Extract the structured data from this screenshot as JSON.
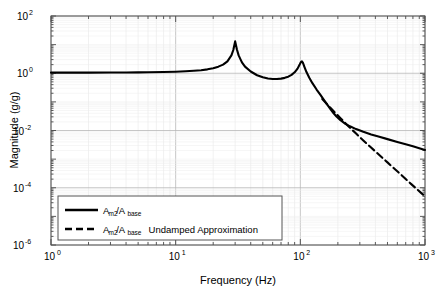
{
  "chart_data": {
    "type": "line",
    "title": "",
    "xlabel": "Frequency (Hz)",
    "ylabel": "Magnitude (g/g)",
    "xscale": "log",
    "yscale": "log",
    "xlim": [
      1,
      1000
    ],
    "ylim": [
      1e-06,
      100
    ],
    "grid": true,
    "xticks": [
      1,
      10,
      100,
      1000
    ],
    "xtick_labels": [
      "10^0",
      "10^1",
      "10^2",
      "10^3"
    ],
    "xtick_mantissa": [
      "10",
      "10",
      "10",
      "10"
    ],
    "xtick_exponents": [
      "0",
      "1",
      "2",
      "3"
    ],
    "yticks": [
      100,
      1,
      0.01,
      0.0001,
      1e-06
    ],
    "ytick_labels": [
      "10^2",
      "10^0",
      "10^-2",
      "10^-4",
      "10^-6"
    ],
    "ytick_mantissa": [
      "10",
      "10",
      "10",
      "10",
      "10"
    ],
    "ytick_exponents": [
      "2",
      "0",
      "-2",
      "-4",
      "-6"
    ],
    "legend_position": "lower-left",
    "resonances_hz": [
      30,
      103
    ],
    "peak_values": [
      13,
      2.6
    ],
    "series": [
      {
        "name": "A_m2/A_base",
        "style": "solid",
        "color": "#000000",
        "points": [
          [
            1.0,
            1.05
          ],
          [
            1.5,
            1.05
          ],
          [
            2.0,
            1.05
          ],
          [
            3.0,
            1.06
          ],
          [
            4.0,
            1.06
          ],
          [
            5.0,
            1.07
          ],
          [
            6.0,
            1.08
          ],
          [
            8.0,
            1.1
          ],
          [
            10.0,
            1.13
          ],
          [
            12.0,
            1.17
          ],
          [
            14.0,
            1.22
          ],
          [
            16.0,
            1.28
          ],
          [
            18.0,
            1.37
          ],
          [
            20.0,
            1.5
          ],
          [
            22.0,
            1.7
          ],
          [
            24.0,
            2.0
          ],
          [
            26.0,
            2.6
          ],
          [
            28.0,
            4.2
          ],
          [
            29.0,
            6.5
          ],
          [
            30.0,
            13.0
          ],
          [
            31.0,
            6.8
          ],
          [
            32.0,
            4.2
          ],
          [
            34.0,
            2.4
          ],
          [
            36.0,
            1.7
          ],
          [
            40.0,
            1.15
          ],
          [
            45.0,
            0.85
          ],
          [
            50.0,
            0.72
          ],
          [
            55.0,
            0.66
          ],
          [
            60.0,
            0.63
          ],
          [
            65.0,
            0.63
          ],
          [
            70.0,
            0.65
          ],
          [
            75.0,
            0.69
          ],
          [
            80.0,
            0.76
          ],
          [
            85.0,
            0.88
          ],
          [
            90.0,
            1.08
          ],
          [
            95.0,
            1.45
          ],
          [
            99.0,
            2.05
          ],
          [
            101.0,
            2.45
          ],
          [
            103.0,
            2.6
          ],
          [
            105.0,
            2.3
          ],
          [
            108.0,
            1.65
          ],
          [
            112.0,
            1.1
          ],
          [
            118.0,
            0.7
          ],
          [
            125.0,
            0.45
          ],
          [
            135.0,
            0.27
          ],
          [
            145.0,
            0.175
          ],
          [
            155.0,
            0.115
          ],
          [
            165.0,
            0.078
          ],
          [
            175.0,
            0.055
          ],
          [
            185.0,
            0.04
          ],
          [
            195.0,
            0.031
          ],
          [
            210.0,
            0.023
          ],
          [
            230.0,
            0.017
          ],
          [
            250.0,
            0.014
          ],
          [
            280.0,
            0.0112
          ],
          [
            320.0,
            0.009
          ],
          [
            370.0,
            0.0073
          ],
          [
            430.0,
            0.006
          ],
          [
            500.0,
            0.005
          ],
          [
            600.0,
            0.004
          ],
          [
            700.0,
            0.0033
          ],
          [
            800.0,
            0.0028
          ],
          [
            900.0,
            0.0024
          ],
          [
            1000.0,
            0.0021
          ]
        ]
      },
      {
        "name": "A_m2/A_base Undamped Approximation",
        "style": "dashdot",
        "color": "#000000",
        "points": [
          [
            150.0,
            0.125
          ],
          [
            160.0,
            0.092
          ],
          [
            175.0,
            0.061
          ],
          [
            190.0,
            0.042
          ],
          [
            210.0,
            0.027
          ],
          [
            230.0,
            0.018
          ],
          [
            250.0,
            0.0125
          ],
          [
            280.0,
            0.0078
          ],
          [
            320.0,
            0.0045
          ],
          [
            360.0,
            0.0028
          ],
          [
            400.0,
            0.00185
          ],
          [
            450.0,
            0.00116
          ],
          [
            500.0,
            0.00077
          ],
          [
            560.0,
            0.00049
          ],
          [
            620.0,
            0.00033
          ],
          [
            700.0,
            0.000202
          ],
          [
            780.0,
            0.000131
          ],
          [
            860.0,
            8.95e-05
          ],
          [
            930.0,
            6.62e-05
          ],
          [
            1000.0,
            5e-05
          ]
        ]
      }
    ],
    "legend": [
      {
        "label_main": "A",
        "label_sub1": "m2",
        "label_slash": "/A",
        "label_sub2": "base",
        "label_extra": "",
        "style": "solid"
      },
      {
        "label_main": "A",
        "label_sub1": "m2",
        "label_slash": "/A",
        "label_sub2": "base",
        "label_extra": "Undamped Approximation",
        "style": "dashdot"
      }
    ]
  }
}
